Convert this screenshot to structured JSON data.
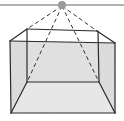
{
  "diagram": {
    "colors": {
      "background": "#ffffff",
      "edges": "#2a2a2a",
      "rays": "#333333",
      "ceiling": "#999999",
      "light": "#9a9a9a",
      "shading": "#d9d9d9",
      "floor": "#ebebeb"
    },
    "elements": {
      "ceiling_line": "ceiling",
      "light_source": "light-bulb",
      "rays": [
        "ray-to-back-top-left",
        "ray-to-back-bottom-left",
        "ray-to-back-bottom-right",
        "ray-to-back-top-right"
      ],
      "box": "room-box"
    }
  }
}
